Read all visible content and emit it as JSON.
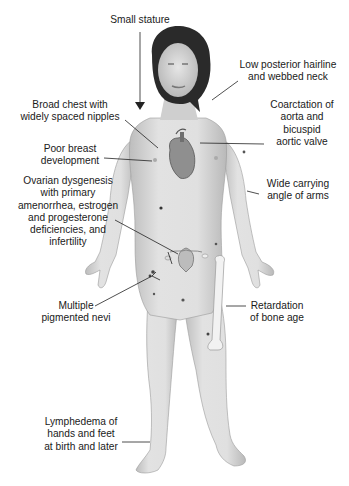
{
  "diagram": {
    "colors": {
      "background": "#ffffff",
      "skin": "#d9d9d9",
      "skin_shadow": "#b8b8b8",
      "hair": "#2a2a2a",
      "line": "#222222",
      "text": "#1a1a1a"
    },
    "labels": [
      {
        "id": "small-stature",
        "text": "Small stature"
      },
      {
        "id": "hairline-neck",
        "text": "Low posterior hairline\nand webbed neck"
      },
      {
        "id": "broad-chest",
        "text": "Broad chest with\nwidely spaced nipples"
      },
      {
        "id": "coarctation",
        "text": "Coarctation of\naorta and\nbicuspid\naortic valve"
      },
      {
        "id": "breast",
        "text": "Poor breast\ndevelopment"
      },
      {
        "id": "ovarian",
        "text": "Ovarian dysgenesis\nwith primary\namenorrhea, estrogen\nand progesterone\ndeficiencies, and\ninfertility"
      },
      {
        "id": "carrying-angle",
        "text": "Wide carrying\nangle of arms"
      },
      {
        "id": "nevi",
        "text": "Multiple\npigmented nevi"
      },
      {
        "id": "bone-age",
        "text": "Retardation\nof bone age"
      },
      {
        "id": "lymphedema",
        "text": "Lymphedema of\nhands and feet\nat birth and later"
      }
    ]
  }
}
